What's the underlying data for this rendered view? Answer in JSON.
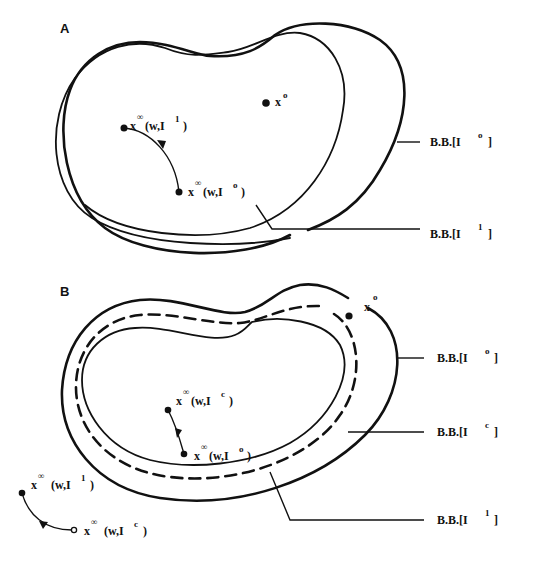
{
  "panels": [
    {
      "id": "A",
      "label": "A",
      "points": [
        {
          "base": "x",
          "sup": "o",
          "rest": ""
        },
        {
          "base": "x",
          "sup": "∞",
          "rest": "(w,I",
          "sup2": "1",
          "close": ")"
        },
        {
          "base": "x",
          "sup": "∞",
          "rest": "(w,I",
          "sup2": "o",
          "close": ")"
        }
      ],
      "boundaries": [
        {
          "prefix": "B.B.[I",
          "sup": "o",
          "close": "]"
        },
        {
          "prefix": "B.B.[I",
          "sup": "1",
          "close": "]"
        }
      ]
    },
    {
      "id": "B",
      "label": "B",
      "points": [
        {
          "base": "x",
          "sup": "o",
          "rest": ""
        },
        {
          "base": "x",
          "sup": "∞",
          "rest": "(w,I",
          "sup2": "c",
          "close": ")"
        },
        {
          "base": "x",
          "sup": "∞",
          "rest": "(w,I",
          "sup2": "o",
          "close": ")"
        },
        {
          "base": "x",
          "sup": "∞",
          "rest": "(w,I",
          "sup2": "1",
          "close": ")"
        },
        {
          "base": "x",
          "sup": "∞",
          "rest": "(w,I",
          "sup2": "c",
          "close": ")"
        }
      ],
      "boundaries": [
        {
          "prefix": "B.B.[I",
          "sup": "o",
          "close": "]"
        },
        {
          "prefix": "B.B.[I",
          "sup": "c",
          "close": "]"
        },
        {
          "prefix": "B.B.[I",
          "sup": "1",
          "close": "]"
        }
      ]
    }
  ]
}
